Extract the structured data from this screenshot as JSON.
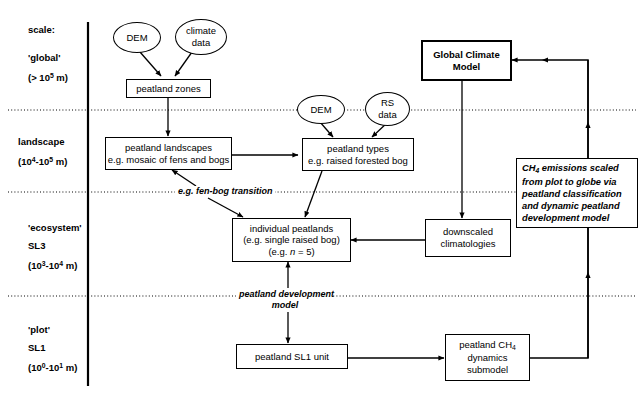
{
  "diagram": {
    "axis_label": "scale:",
    "scales": [
      {
        "name": "global",
        "label": "'global'",
        "range": "(> 10^5 m)",
        "range_base": "(> 10",
        "range_exp": "5",
        "range_tail": " m)"
      },
      {
        "name": "landscape",
        "label": "landscape",
        "range_base": "(10",
        "range_exp1": "4",
        "range_mid": "-10",
        "range_exp2": "5",
        "range_tail": " m)"
      },
      {
        "name": "ecosystem",
        "label": "'ecosystem'",
        "sublabel": "SL3",
        "range_base": "(10",
        "range_exp1": "3",
        "range_mid": "-10",
        "range_exp2": "4",
        "range_tail": " m)"
      },
      {
        "name": "plot",
        "label": "'plot'",
        "sublabel": "SL1",
        "range_base": "(10",
        "range_exp1": "0",
        "range_mid": "-10",
        "range_exp2": "1",
        "range_tail": " m)"
      }
    ],
    "nodes": {
      "dem_global": {
        "label": "DEM",
        "shape": "ellipse"
      },
      "climate_data": {
        "line1": "climate",
        "line2": "data",
        "shape": "ellipse"
      },
      "peatland_zones": {
        "label": "peatland zones",
        "shape": "box"
      },
      "peatland_landscapes": {
        "line1": "peatland landscapes",
        "line2": "e.g. mosaic of fens and bogs",
        "shape": "box"
      },
      "dem_landscape": {
        "label": "DEM",
        "shape": "ellipse"
      },
      "rs_data": {
        "line1": "RS",
        "line2": "data",
        "shape": "ellipse"
      },
      "peatland_types": {
        "line1": "peatland types",
        "line2": "e.g. raised forested bog",
        "shape": "box"
      },
      "global_climate_model": {
        "line1": "Global Climate",
        "line2": "Model",
        "shape": "box-thick"
      },
      "ch4_note": {
        "line1_pre": "CH",
        "line1_sub": "4",
        "line1_post": " emissions scaled",
        "line2": "from plot to globe via",
        "line3": "peatland classification",
        "line4": "and dynamic peatland",
        "line5": "development model",
        "shape": "note"
      },
      "individual_peatlands": {
        "line1": "individual peatlands",
        "line2": "(e.g. single raised bog)",
        "line3_pre": "(e.g. ",
        "line3_var": "n",
        "line3_post": " = 5)",
        "shape": "box"
      },
      "downscaled_climatologies": {
        "line1": "downscaled",
        "line2": "climatologies",
        "shape": "box"
      },
      "peatland_sl1_unit": {
        "label": "peatland SL1 unit",
        "shape": "box"
      },
      "ch4_submodel": {
        "line1_pre": "peatland CH",
        "line1_sub": "4",
        "line2": "dynamics",
        "line3": "submodel",
        "shape": "box"
      }
    },
    "edge_labels": {
      "fen_bog_transition": "e.g. fen-bog transition",
      "peatland_development_model_l1": "peatland development",
      "peatland_development_model_l2": "model"
    },
    "colors": {
      "stroke": "#000000",
      "background": "#ffffff"
    }
  }
}
